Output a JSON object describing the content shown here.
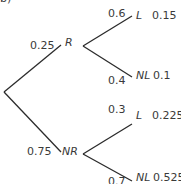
{
  "part_label": "b)",
  "tree": {
    "first_level": [
      {
        "event": "R",
        "probability": "0.25"
      },
      {
        "event": "NR",
        "probability": "0.75"
      }
    ],
    "second_level": {
      "R": [
        {
          "event": "L",
          "probability": "0.6",
          "joint": "0.15"
        },
        {
          "event": "NL",
          "probability": "0.4",
          "joint": "0.1"
        }
      ],
      "NR": [
        {
          "event": "L",
          "probability": "0.3",
          "joint": "0.225"
        },
        {
          "event": "NL",
          "probability": "0.7",
          "joint": "0.525"
        }
      ]
    }
  },
  "colors": {
    "line": "#2b2b2b",
    "text": "#3a3a3a",
    "background": "#ffffff"
  }
}
